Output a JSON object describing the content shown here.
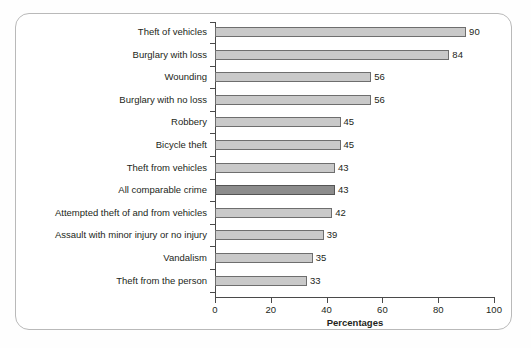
{
  "chart_data": {
    "type": "bar",
    "orientation": "horizontal",
    "title": "",
    "xlabel": "Percentages",
    "ylabel": "",
    "xlim": [
      0,
      100
    ],
    "xticks": [
      0,
      20,
      40,
      60,
      80,
      100
    ],
    "grid": false,
    "legend": null,
    "categories": [
      "Theft of vehicles",
      "Burglary with loss",
      "Wounding",
      "Burglary with no loss",
      "Robbery",
      "Bicycle theft",
      "Theft from vehicles",
      "All comparable crime",
      "Attempted theft of and from vehicles",
      "Assault with minor injury or no injury",
      "Vandalism",
      "Theft from the person"
    ],
    "values": [
      90,
      84,
      56,
      56,
      45,
      45,
      43,
      43,
      42,
      39,
      35,
      33
    ],
    "value_labels": [
      "90",
      "84",
      "56",
      "56",
      "45",
      "45",
      "43",
      "43",
      "42",
      "39",
      "35",
      "33"
    ],
    "highlight_index": 7,
    "colors": {
      "bar_fill": "#c9c9c9",
      "bar_stroke": "#6e6e6e",
      "highlight_fill": "#8c8c8c",
      "highlight_stroke": "#555555",
      "axis": "#4a4a4a",
      "text": "#231f20",
      "frame": "#b9b9b9",
      "background": "#ffffff"
    }
  }
}
